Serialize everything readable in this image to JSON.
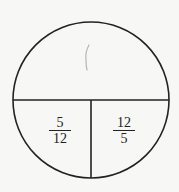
{
  "diagram": {
    "type": "circle-partition",
    "colors": {
      "stroke": "#222222",
      "background": "#f7f7f5",
      "pencil_mark": "#b5b5b5"
    },
    "top_region": {
      "mark": "("
    },
    "bottom_left": {
      "numerator": "5",
      "denominator": "12"
    },
    "bottom_right": {
      "numerator": "12",
      "denominator": "5"
    }
  }
}
